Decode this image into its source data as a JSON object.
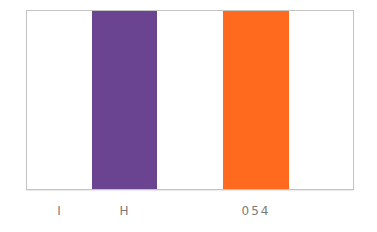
{
  "swatch": {
    "background_color": "#ffffff",
    "stripes": [
      {
        "name": "purple",
        "color": "#6b4491"
      },
      {
        "name": "orange",
        "color": "#ff6a1e"
      }
    ]
  },
  "labels": [
    "I",
    "H",
    "054"
  ]
}
